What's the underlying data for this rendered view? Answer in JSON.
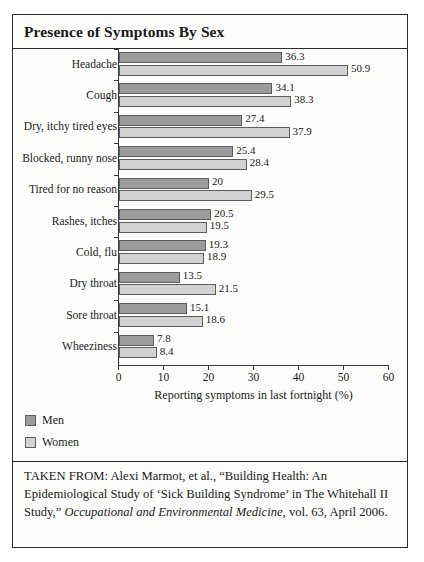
{
  "figure": {
    "title": "Presence of Symptoms By Sex",
    "source_prefix": "TAKEN FROM: Alexi Marmot, et al., “Building Health: An Epidemiological Study of ‘Sick Building Syndrome’ in The Whitehall II Study,” ",
    "source_italic": "Occupational and Environmental Medicine",
    "source_suffix": ", vol. 63, April 2006."
  },
  "colors": {
    "men": "#9c9c9c",
    "women": "#d2d2d2",
    "bar_outline": "#5d5d5d",
    "frame": "#2b2b2b",
    "background": "#fdfdfc",
    "text": "#1a1a1a"
  },
  "legend": {
    "position": "below-axis-left",
    "entries": [
      {
        "label": "Men",
        "key": "men"
      },
      {
        "label": "Women",
        "key": "women"
      }
    ]
  },
  "chart_data": {
    "type": "bar",
    "orientation": "horizontal",
    "title": "Presence of Symptoms By Sex",
    "subtitle": "",
    "xlabel": "Reporting symptoms in last fortnight (%)",
    "ylabel": "",
    "xlim": [
      0,
      60
    ],
    "xticks": [
      0,
      10,
      20,
      30,
      40,
      50,
      60
    ],
    "xtick_labels": [
      "0",
      "10",
      "20",
      "30",
      "40",
      "50",
      "60"
    ],
    "grid": false,
    "legend_position": "bottom-left",
    "categories": [
      "Headache",
      "Cough",
      "Dry, itchy tired eyes",
      "Blocked, runny nose",
      "Tired for no reason",
      "Rashes, itches",
      "Cold, flu",
      "Dry throat",
      "Sore throat",
      "Wheeziness"
    ],
    "series": [
      {
        "name": "Men",
        "color": "#9c9c9c",
        "values": [
          36.3,
          34.1,
          27.4,
          25.4,
          20,
          20.5,
          19.3,
          13.5,
          15.1,
          7.8
        ],
        "labels": [
          "36.3",
          "34.1",
          "27.4",
          "25.4",
          "20",
          "20.5",
          "19.3",
          "13.5",
          "15.1",
          "7.8"
        ]
      },
      {
        "name": "Women",
        "color": "#d2d2d2",
        "values": [
          50.9,
          38.3,
          37.9,
          28.4,
          29.5,
          19.5,
          18.9,
          21.5,
          18.6,
          8.4
        ],
        "labels": [
          "50.9",
          "38.3",
          "37.9",
          "28.4",
          "29.5",
          "19.5",
          "18.9",
          "21.5",
          "18.6",
          "8.4"
        ]
      }
    ]
  }
}
